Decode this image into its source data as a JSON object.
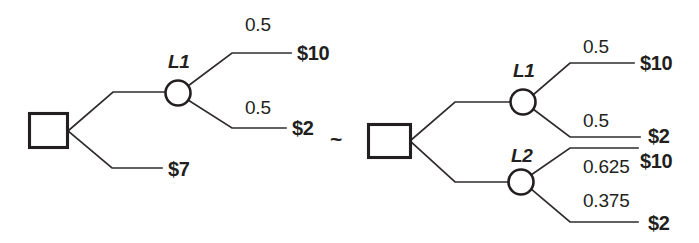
{
  "figure": {
    "relation_symbol": "~",
    "line_color": "#302c2d",
    "text_color": "#231f20",
    "background": "#ffffff"
  },
  "left_tree": {
    "root": {
      "type": "decision-square",
      "x": 48,
      "y": 130,
      "w": 39,
      "h": 34
    },
    "branches": {
      "upper": {
        "node": {
          "type": "chance-circle",
          "label": "L1",
          "cx": 178,
          "cy": 93,
          "r": 12.5
        },
        "outcomes": [
          {
            "probability": "0.5",
            "payoff": "$10",
            "prob_x": 245,
            "prob_y": 31,
            "line_y": 53,
            "line_x1": 232,
            "line_x2": 291,
            "payoff_x": 297,
            "payoff_y": 60
          },
          {
            "probability": "0.5",
            "payoff": "$2",
            "prob_x": 245,
            "prob_y": 114,
            "line_y": 128,
            "line_x1": 232,
            "line_x2": 286,
            "payoff_x": 292,
            "payoff_y": 135
          }
        ]
      },
      "lower": {
        "payoff": "$7",
        "line_y": 168,
        "line_x1": 112,
        "line_x2": 162,
        "payoff_x": 168,
        "payoff_y": 176
      }
    }
  },
  "right_tree": {
    "root": {
      "type": "decision-square",
      "x": 389,
      "y": 141,
      "w": 42,
      "h": 34
    },
    "branches": {
      "upper": {
        "node": {
          "type": "chance-circle",
          "label": "L1",
          "cx": 523,
          "cy": 102,
          "r": 12.5
        },
        "outcomes": [
          {
            "probability": "0.5",
            "payoff": "$10",
            "prob_x": 583,
            "prob_y": 53,
            "line_y": 63,
            "line_x1": 570,
            "line_x2": 634,
            "payoff_x": 640,
            "payoff_y": 70
          },
          {
            "probability": "0.5",
            "payoff": "$2",
            "prob_x": 583,
            "prob_y": 127,
            "line_y": 137,
            "line_x1": 570,
            "line_x2": 640,
            "payoff_x": 648,
            "payoff_y": 143
          }
        ]
      },
      "lower": {
        "node": {
          "type": "chance-circle",
          "label": "L2",
          "cx": 521,
          "cy": 182,
          "r": 12.5
        },
        "outcomes": [
          {
            "probability": "0.625",
            "payoff": "$10",
            "prob_x": 583,
            "prob_y": 173,
            "line_y": 148,
            "line_x1": 570,
            "line_x2": 638,
            "payoff_x": 640,
            "payoff_y": 168
          },
          {
            "probability": "0.375",
            "payoff": "$2",
            "prob_x": 583,
            "prob_y": 207,
            "line_y": 222,
            "line_x1": 570,
            "line_x2": 638,
            "payoff_x": 648,
            "payoff_y": 230
          }
        ]
      }
    }
  },
  "node_labels": {
    "left_l1": {
      "text": "L1",
      "x": 168,
      "y": 68
    },
    "right_l1": {
      "text": "L1",
      "x": 513,
      "y": 77
    },
    "right_l2": {
      "text": "L2",
      "x": 511,
      "y": 162
    }
  },
  "relation": {
    "symbol": "~",
    "x": 330,
    "y": 146
  }
}
